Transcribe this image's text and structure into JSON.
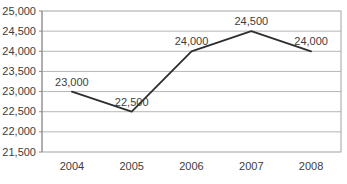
{
  "chart_data": {
    "type": "line",
    "title": "",
    "xlabel": "",
    "ylabel": "",
    "categories": [
      "2004",
      "2005",
      "2006",
      "2007",
      "2008"
    ],
    "series": [
      {
        "name": "values",
        "values": [
          23000,
          22500,
          24000,
          24500,
          24000
        ],
        "data_labels": [
          "23,000",
          "22,500",
          "24,000",
          "24,500",
          "24,000"
        ]
      }
    ],
    "y_ticks": [
      {
        "value": 25000,
        "label": "25,000"
      },
      {
        "value": 24500,
        "label": "24,500"
      },
      {
        "value": 24000,
        "label": "24,000"
      },
      {
        "value": 23500,
        "label": "23,500"
      },
      {
        "value": 23000,
        "label": "23,000"
      },
      {
        "value": 22500,
        "label": "22,500"
      },
      {
        "value": 22000,
        "label": "22,000"
      },
      {
        "value": 21500,
        "label": "21,500"
      }
    ],
    "ylim": [
      21500,
      25000
    ],
    "y_step": 500,
    "grid": true,
    "legend": "none",
    "marker": "none",
    "colors": {
      "line": "#2e2e2e",
      "grid": "#b6b6b6",
      "border": "#a3a3a3",
      "axis": "#8c8c8c",
      "text": "#3d3d3d",
      "background": "#ffffff"
    }
  }
}
